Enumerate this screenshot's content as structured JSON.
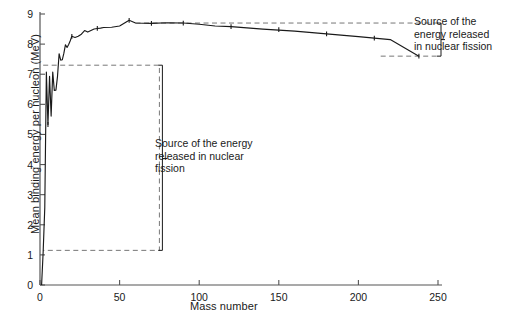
{
  "chart_data": {
    "type": "line",
    "title": "",
    "xlabel": "Mass number",
    "ylabel": "Mean binding energy per nucleon (MeV)",
    "xlim": [
      0,
      260
    ],
    "ylim": [
      0,
      9
    ],
    "xticks": [
      0,
      50,
      100,
      150,
      200,
      250
    ],
    "xtick_labels": [
      "0",
      "50",
      "100",
      "150",
      "200",
      "250"
    ],
    "yticks": [
      0,
      1,
      2,
      3,
      4,
      5,
      6,
      7,
      8,
      9
    ],
    "ytick_labels": [
      "0",
      "1",
      "2",
      "3",
      "4",
      "5",
      "6",
      "7",
      "8",
      "9"
    ],
    "grid": false,
    "legend": "none",
    "series": [
      {
        "name": "Mean binding energy per nucleon",
        "x": [
          1,
          2,
          3,
          4,
          5,
          6,
          7,
          8,
          9,
          10,
          11,
          12,
          13,
          14,
          15,
          16,
          17,
          18,
          19,
          20,
          22,
          24,
          26,
          28,
          30,
          32,
          34,
          36,
          38,
          40,
          45,
          50,
          56,
          60,
          70,
          80,
          90,
          100,
          110,
          120,
          140,
          160,
          180,
          200,
          220,
          238
        ],
        "y": [
          0.0,
          1.11,
          2.57,
          7.07,
          5.33,
          6.93,
          5.61,
          7.07,
          6.46,
          6.47,
          6.93,
          7.68,
          7.47,
          7.48,
          7.7,
          7.98,
          7.89,
          7.99,
          8.11,
          8.26,
          8.22,
          8.26,
          8.33,
          8.45,
          8.4,
          8.45,
          8.5,
          8.52,
          8.53,
          8.55,
          8.56,
          8.6,
          8.79,
          8.7,
          8.69,
          8.71,
          8.7,
          8.66,
          8.6,
          8.58,
          8.5,
          8.43,
          8.34,
          8.25,
          8.15,
          7.6
        ]
      }
    ],
    "markers": {
      "x": [
        5,
        20,
        36,
        56,
        70,
        90,
        120,
        150,
        180,
        210,
        238
      ],
      "y": [
        5.33,
        8.26,
        8.52,
        8.79,
        8.69,
        8.7,
        8.58,
        8.48,
        8.34,
        8.2,
        7.6
      ]
    },
    "annotations": [
      {
        "name": "fission-region-right",
        "text": "Source of the\nenergy released\nin nuclear fission",
        "bracket_top_value": 8.7,
        "bracket_bottom_value": 7.6,
        "bracket_x": 250
      },
      {
        "name": "fission-region-inner",
        "text": "Source of the energy\nreleased in nuclear\nfission",
        "bracket_top_value": 7.3,
        "bracket_bottom_value": 1.15,
        "bracket_x": 75
      }
    ],
    "dashed_boxes": [
      {
        "name": "fusion-box",
        "x0": 2,
        "x1": 75,
        "y0": 1.15,
        "y1": 7.3
      },
      {
        "name": "fission-band",
        "x0": 60,
        "x1": 250,
        "y0": 7.6,
        "y1": 8.7
      }
    ],
    "colors": {
      "line": "#1a1a1a",
      "axis": "#555555",
      "dashed": "#777777",
      "text": "#1a1a1a",
      "background": "#ffffff"
    }
  },
  "labels": {
    "x_axis_title": "Mass number",
    "y_axis_title": "Mean binding energy per nucleon (MeV)",
    "annotation_right": "Source of the\nenergy released\nin nuclear fission",
    "annotation_inner": "Source of the energy\nreleased in nuclear\nfission"
  }
}
